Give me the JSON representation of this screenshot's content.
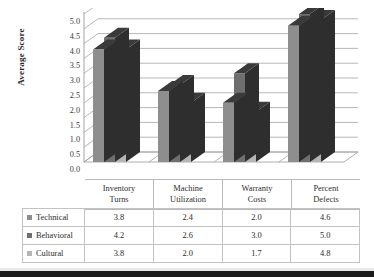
{
  "chart_data": {
    "type": "bar",
    "title": "",
    "xlabel": "",
    "ylabel": "Average Score",
    "ylim": [
      0.0,
      5.0
    ],
    "ytick_labels": [
      "5.0",
      "4.5",
      "4.0",
      "3.5",
      "3.0",
      "2.5",
      "2.0",
      "1.5",
      "1.0",
      "0.5",
      "0.0"
    ],
    "ytick_values": [
      5.0,
      4.5,
      4.0,
      3.5,
      3.0,
      2.5,
      2.0,
      1.5,
      1.0,
      0.5,
      0.0
    ],
    "grid": true,
    "legend_position": "data-table-left",
    "three_d": true,
    "categories": [
      "Inventory Turns",
      "Machine Utilization",
      "Warranty Costs",
      "Percent Defects"
    ],
    "category_lines": [
      [
        "Inventory",
        "Turns"
      ],
      [
        "Machine",
        "Utilization"
      ],
      [
        "Warranty",
        "Costs"
      ],
      [
        "Percent",
        "Defects"
      ]
    ],
    "series": [
      {
        "name": "Technical",
        "color": "#8e8e8e",
        "values": [
          3.8,
          2.4,
          2.0,
          4.6
        ]
      },
      {
        "name": "Behavioral",
        "color": "#6f6f6f",
        "values": [
          4.2,
          2.6,
          3.0,
          5.0
        ]
      },
      {
        "name": "Cultural",
        "color": "#b6b6b6",
        "values": [
          3.8,
          2.0,
          1.7,
          4.8
        ]
      }
    ],
    "value_labels": {
      "Technical": [
        "3.8",
        "2.4",
        "2.0",
        "4.6"
      ],
      "Behavioral": [
        "4.2",
        "2.6",
        "3.0",
        "5.0"
      ],
      "Cultural": [
        "3.8",
        "2.0",
        "1.7",
        "4.8"
      ]
    }
  },
  "colors": {
    "series_technical": "#8e8e8e",
    "series_behavioral": "#6f6f6f",
    "series_cultural": "#b6b6b6",
    "top_face": "#3a3a3a",
    "side_face": "#2e2e2e",
    "gridline": "#9a9a9a",
    "table_border": "#c3c3c3",
    "background": "#ffffff",
    "text": "#2b2b2b"
  }
}
